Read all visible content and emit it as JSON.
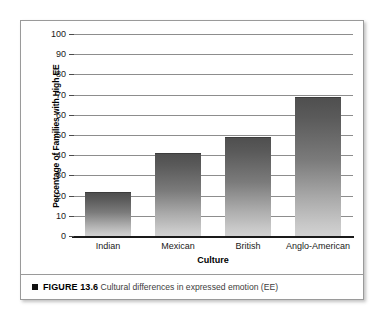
{
  "chart_data": {
    "type": "bar",
    "title": "",
    "categories": [
      "Indian",
      "Mexican",
      "British",
      "Anglo-American"
    ],
    "values": [
      22,
      41,
      49,
      69
    ],
    "xlabel": "Culture",
    "ylabel": "Percentage of Families with High EE",
    "ylim": [
      0,
      100
    ],
    "ytick_labels": [
      "0",
      "10",
      "20",
      "30",
      "40",
      "50",
      "60",
      "70",
      "80",
      "90",
      "100"
    ],
    "ytick_values": [
      0,
      10,
      20,
      30,
      40,
      50,
      60,
      70,
      80,
      90,
      100
    ],
    "grid": true,
    "legend": false,
    "bar_color_top": "#4f4f4f",
    "bar_color_bottom": "#d2d2d2"
  },
  "caption": {
    "bullet": "square-bullet-icon",
    "label": "FIGURE 13.6",
    "text": "Cultural differences in expressed emotion (EE)"
  }
}
